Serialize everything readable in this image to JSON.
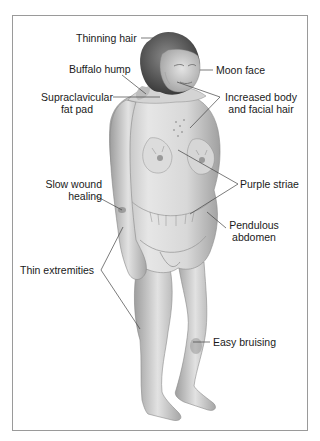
{
  "figure": {
    "colors": {
      "frame_border": "#9a9a9a",
      "text": "#1a1a1a",
      "leader_line": "#444444",
      "skin_light": "#e8e8e8",
      "skin_shadow": "#9c9c9c",
      "hair": "#4a4a4a",
      "bruise": "#6e6e6e"
    },
    "labels": {
      "thinning_hair": "Thinning hair",
      "buffalo_hump": "Buffalo hump",
      "moon_face": "Moon face",
      "supraclavicular_line1": "Supraclavicular",
      "supraclavicular_line2": "fat pad",
      "increased_hair_line1": "Increased body",
      "increased_hair_line2": "and facial hair",
      "purple_striae": "Purple striae",
      "slow_wound_line1": "Slow wound",
      "slow_wound_line2": "healing",
      "pendulous_line1": "Pendulous",
      "pendulous_line2": "abdomen",
      "thin_extremities": "Thin extremities",
      "easy_bruising": "Easy bruising"
    }
  }
}
